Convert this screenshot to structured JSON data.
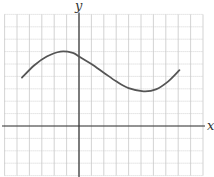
{
  "graph": {
    "x_axis_label": "x",
    "y_axis_label": "y",
    "grid": {
      "unit_px": 12.4,
      "origin_px": [
        79,
        126
      ],
      "x_range_units": [
        -6,
        10
      ],
      "y_range_units": [
        -4,
        9
      ],
      "minor_style": "dotted",
      "color": "#c8c8c8"
    },
    "axis_color": "#333333",
    "curve_color": "#555555",
    "curve_points_units": [
      [
        -4.6,
        3.9
      ],
      [
        -3.6,
        4.9
      ],
      [
        -2.6,
        5.6
      ],
      [
        -1.5,
        6.0
      ],
      [
        -0.5,
        5.9
      ],
      [
        0.0,
        5.6
      ],
      [
        1.0,
        5.0
      ],
      [
        2.0,
        4.3
      ],
      [
        3.0,
        3.6
      ],
      [
        4.0,
        3.05
      ],
      [
        5.2,
        2.8
      ],
      [
        6.2,
        2.95
      ],
      [
        7.2,
        3.6
      ],
      [
        8.1,
        4.5
      ]
    ]
  },
  "chart_data": {
    "type": "line",
    "title": "",
    "xlabel": "x",
    "ylabel": "y",
    "grid": true,
    "x": [
      -4.6,
      -3.6,
      -2.6,
      -1.5,
      -0.5,
      0.0,
      1.0,
      2.0,
      3.0,
      4.0,
      5.2,
      6.2,
      7.2,
      8.1
    ],
    "series": [
      {
        "name": "f(x)",
        "values": [
          3.9,
          4.9,
          5.6,
          6.0,
          5.9,
          5.6,
          5.0,
          4.3,
          3.6,
          3.05,
          2.8,
          2.95,
          3.6,
          4.5
        ]
      }
    ],
    "xlim": [
      -6,
      10
    ],
    "ylim": [
      -4,
      9
    ],
    "annotations": [
      "local maximum near x≈-1.5",
      "local minimum near x≈5.2"
    ]
  }
}
